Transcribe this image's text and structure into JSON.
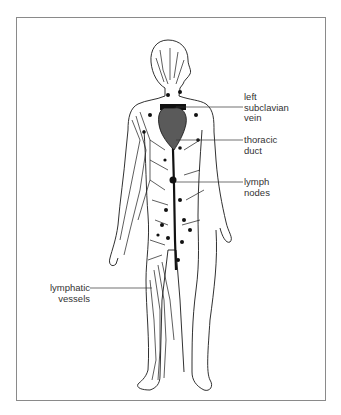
{
  "diagram": {
    "labels": {
      "left_subclavian_vein": [
        "left",
        "subclavian",
        "vein"
      ],
      "thoracic_duct": [
        "thoracic",
        "duct"
      ],
      "lymph_nodes": [
        "lymph",
        "nodes"
      ],
      "lymphatic_vessels": [
        "lymphatic",
        "vessels"
      ]
    },
    "colors": {
      "outline": "#1a1a1a",
      "heart": "#5a5a5a",
      "frame": "#8a8a8a",
      "text": "#333333"
    }
  }
}
